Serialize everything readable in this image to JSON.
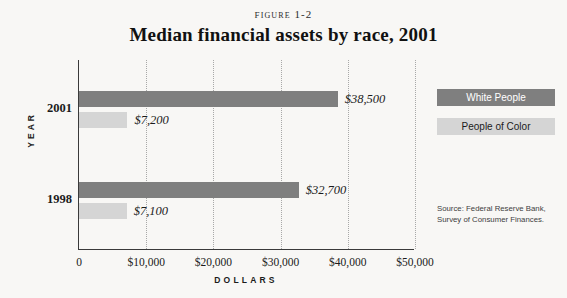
{
  "figure_number": "Figure 1-2",
  "legend": {
    "items": [
      {
        "label": "White People",
        "color": "#7f7f7f",
        "series": "white_people"
      },
      {
        "label": "People of Color",
        "color": "#d5d5d5",
        "series": "people_of_color"
      }
    ]
  },
  "source_note": "Source: Federal Reserve Bank, Survey of Consumer Finances.",
  "chart_data": {
    "type": "bar",
    "orientation": "horizontal",
    "title": "Median financial assets by race, 2001",
    "xlabel": "DOLLARS",
    "ylabel": "YEAR",
    "categories": [
      "2001",
      "1998"
    ],
    "xlim": [
      0,
      50000
    ],
    "xticks": [
      0,
      10000,
      20000,
      30000,
      40000,
      50000
    ],
    "xtick_labels": [
      "0",
      "$10,000",
      "$20,000",
      "$30,000",
      "$40,000",
      "$50,000"
    ],
    "grid": "vertical-dotted",
    "legend_position": "right",
    "series": [
      {
        "name": "White People",
        "color": "#7f7f7f",
        "values": [
          38500,
          32700
        ],
        "data_labels": [
          "$38,500",
          "$32,700"
        ]
      },
      {
        "name": "People of Color",
        "color": "#d5d5d5",
        "values": [
          7200,
          7100
        ],
        "data_labels": [
          "$7,200",
          "$7,100"
        ]
      }
    ]
  }
}
